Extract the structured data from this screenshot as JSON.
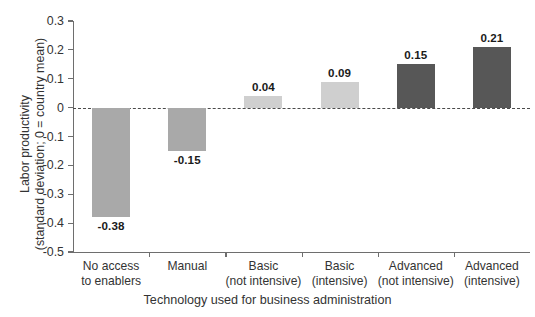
{
  "chart_data": {
    "type": "bar",
    "title": "",
    "subtitle": "",
    "xlabel": "Technology used for business administration",
    "ylabel_line1": "Labor productivity",
    "ylabel_line2": "(standard deviation; 0 = country mean)",
    "categories": [
      "No access\nto enablers",
      "Manual",
      "Basic\n(not intensive)",
      "Basic\n(intensive)",
      "Advanced\n(not intensive)",
      "Advanced\n(intensive)"
    ],
    "category_lines": [
      [
        "No access",
        "to enablers"
      ],
      [
        "Manual",
        ""
      ],
      [
        "Basic",
        "(not intensive)"
      ],
      [
        "Basic",
        "(intensive)"
      ],
      [
        "Advanced",
        "(not intensive)"
      ],
      [
        "Advanced",
        "(intensive)"
      ]
    ],
    "values": [
      -0.38,
      -0.15,
      0.04,
      0.09,
      0.15,
      0.21
    ],
    "value_labels": [
      "-0.38",
      "-0.15",
      "0.04",
      "0.09",
      "0.15",
      "0.21"
    ],
    "bar_colors": [
      "#a9a9a9",
      "#a9a9a9",
      "#cfcfcf",
      "#cfcfcf",
      "#575757",
      "#575757"
    ],
    "ylim": [
      -0.5,
      0.3
    ],
    "ytick_values": [
      0.3,
      0.2,
      0.1,
      0,
      -0.1,
      -0.2,
      -0.3,
      -0.4,
      -0.5
    ],
    "ytick_labels": [
      "0.3",
      "0.2",
      "0.1",
      "0",
      "-0.1",
      "-0.2",
      "-0.3",
      "-0.4",
      "-0.5"
    ],
    "grid": false,
    "legend": "none",
    "zero_reference_line": true,
    "zero_reference_style": "dashed",
    "axis_color": "#6e6e6e"
  }
}
